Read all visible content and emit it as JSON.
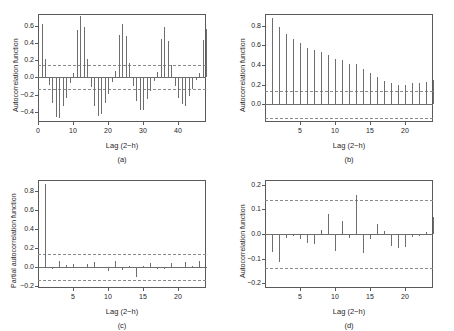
{
  "figure": {
    "background": "#ffffff",
    "bar_color": "#6e6e6e",
    "conf_color": "#8a8a8a",
    "axis_color": "#5a5a5a",
    "text_color": "#262626"
  },
  "chart_data": [
    {
      "type": "bar",
      "panel": "(a)",
      "title": "",
      "xlabel": "Lag (2−h)",
      "ylabel": "Autocorrelation function",
      "xlim": [
        0,
        48
      ],
      "ylim": [
        -0.52,
        0.74
      ],
      "xticks": [
        0,
        10,
        20,
        30,
        40
      ],
      "yticks": [
        -0.4,
        -0.2,
        0.0,
        0.2,
        0.4,
        0.6
      ],
      "ytick_labels": [
        "−0.4",
        "−0.2",
        "0.0",
        "0.2",
        "0.4",
        "0.6"
      ],
      "confidence_bounds": [
        0.14,
        -0.14
      ],
      "grid": false,
      "legend": "none",
      "x": [
        1,
        2,
        3,
        4,
        5,
        6,
        7,
        8,
        9,
        10,
        11,
        12,
        13,
        14,
        15,
        16,
        17,
        18,
        19,
        20,
        21,
        22,
        23,
        24,
        25,
        26,
        27,
        28,
        29,
        30,
        31,
        32,
        33,
        34,
        35,
        36,
        37,
        38,
        39,
        40,
        41,
        42,
        43,
        44,
        45,
        46,
        47,
        48
      ],
      "values": [
        0.62,
        0.21,
        -0.09,
        -0.3,
        -0.46,
        -0.47,
        -0.33,
        -0.24,
        -0.06,
        0.05,
        0.55,
        0.72,
        0.59,
        0.21,
        -0.11,
        -0.33,
        -0.45,
        -0.43,
        -0.3,
        -0.19,
        -0.05,
        0.07,
        0.5,
        0.62,
        0.48,
        0.17,
        -0.1,
        -0.28,
        -0.38,
        -0.38,
        -0.25,
        -0.16,
        -0.04,
        0.06,
        0.45,
        0.59,
        0.43,
        0.14,
        -0.1,
        -0.24,
        -0.31,
        -0.33,
        -0.22,
        -0.14,
        -0.03,
        0.05,
        0.44,
        0.57
      ]
    },
    {
      "type": "bar",
      "panel": "(b)",
      "title": "",
      "xlabel": "Lag (2−h)",
      "ylabel": "Autocorrelation function",
      "xlim": [
        0,
        24
      ],
      "ylim": [
        -0.18,
        0.92
      ],
      "xticks": [
        5,
        10,
        15,
        20
      ],
      "yticks": [
        0.0,
        0.2,
        0.4,
        0.6,
        0.8
      ],
      "ytick_labels": [
        "0.0",
        "0.2",
        "0.4",
        "0.6",
        "0.8"
      ],
      "confidence_bounds": [
        0.14,
        -0.14
      ],
      "grid": false,
      "legend": "none",
      "x": [
        1,
        2,
        3,
        4,
        5,
        6,
        7,
        8,
        9,
        10,
        11,
        12,
        13,
        14,
        15,
        16,
        17,
        18,
        19,
        20,
        21,
        22,
        23,
        24
      ],
      "values": [
        0.88,
        0.79,
        0.72,
        0.67,
        0.62,
        0.57,
        0.55,
        0.53,
        0.5,
        0.46,
        0.45,
        0.41,
        0.41,
        0.36,
        0.32,
        0.28,
        0.24,
        0.22,
        0.2,
        0.2,
        0.22,
        0.22,
        0.23,
        0.25
      ]
    },
    {
      "type": "bar",
      "panel": "(c)",
      "title": "",
      "xlabel": "Lag (2−h)",
      "ylabel": "Partial autocorrelation function",
      "xlim": [
        0,
        24
      ],
      "ylim": [
        -0.22,
        0.92
      ],
      "xticks": [
        5,
        10,
        15,
        20
      ],
      "yticks": [
        -0.2,
        0.0,
        0.2,
        0.4,
        0.6,
        0.8
      ],
      "ytick_labels": [
        "−0.2",
        "0.0",
        "0.2",
        "0.4",
        "0.6",
        "0.8"
      ],
      "confidence_bounds": [
        0.14,
        -0.14
      ],
      "grid": false,
      "legend": "none",
      "x": [
        1,
        2,
        3,
        4,
        5,
        6,
        7,
        8,
        9,
        10,
        11,
        12,
        13,
        14,
        15,
        16,
        17,
        18,
        19,
        20,
        21,
        22,
        23,
        24
      ],
      "values": [
        0.88,
        -0.02,
        0.06,
        0.02,
        0.03,
        -0.01,
        0.03,
        0.05,
        -0.01,
        -0.04,
        0.07,
        -0.03,
        0.01,
        -0.1,
        0.01,
        0.04,
        -0.02,
        -0.02,
        0.04,
        0.0,
        0.05,
        0.01,
        0.06,
        -0.01
      ]
    },
    {
      "type": "bar",
      "panel": "(d)",
      "title": "",
      "xlabel": "Lag (2−h)",
      "ylabel": "Autocorrelation function",
      "xlim": [
        0,
        24
      ],
      "ylim": [
        -0.22,
        0.22
      ],
      "xticks": [
        5,
        10,
        15,
        20
      ],
      "yticks": [
        -0.2,
        -0.1,
        0.0,
        0.1,
        0.2
      ],
      "ytick_labels": [
        "−0.2",
        "−0.1",
        "0.0",
        "0.1",
        "0.2"
      ],
      "confidence_bounds": [
        0.14,
        -0.14
      ],
      "grid": false,
      "legend": "none",
      "x": [
        1,
        2,
        3,
        4,
        5,
        6,
        7,
        8,
        9,
        10,
        11,
        12,
        13,
        14,
        15,
        16,
        17,
        18,
        19,
        20,
        21,
        22,
        23,
        24
      ],
      "values": [
        -0.075,
        -0.115,
        -0.018,
        -0.008,
        -0.022,
        -0.038,
        -0.04,
        0.018,
        0.082,
        -0.068,
        0.053,
        -0.018,
        0.157,
        -0.078,
        -0.022,
        0.04,
        0.012,
        -0.05,
        -0.055,
        -0.052,
        -0.012,
        -0.008,
        0.01,
        0.068
      ]
    }
  ]
}
